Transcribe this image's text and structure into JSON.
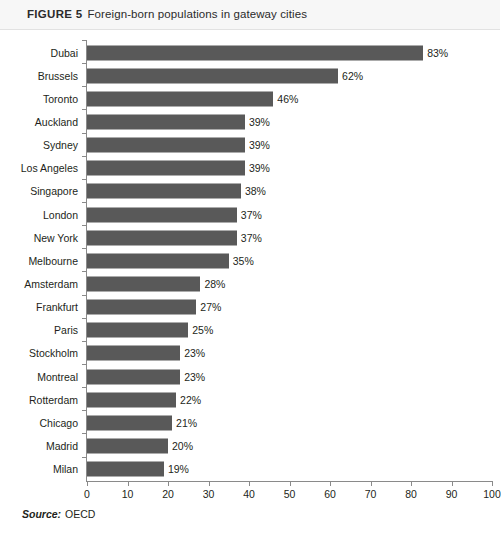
{
  "figure": {
    "number_label": "FIGURE 5",
    "caption": "Foreign-born populations in gateway cities",
    "source_label": "Source:",
    "source_value": "OECD"
  },
  "colors": {
    "bar": "#595959",
    "axis": "#8a8a8a",
    "header_background": "#f7f7f7",
    "text": "#231f20"
  },
  "chart_data": {
    "type": "bar",
    "orientation": "horizontal",
    "title": "Foreign-born populations in gateway cities",
    "xlabel": "",
    "ylabel": "",
    "xlim": [
      0,
      100
    ],
    "xticks": [
      0,
      10,
      20,
      30,
      40,
      50,
      60,
      70,
      80,
      90,
      100
    ],
    "xtick_labels": [
      "0",
      "10",
      "20",
      "30",
      "40",
      "50",
      "60",
      "70",
      "80",
      "90",
      "100"
    ],
    "grid": false,
    "legend": false,
    "value_suffix": "%",
    "categories": [
      "Dubai",
      "Brussels",
      "Toronto",
      "Auckland",
      "Sydney",
      "Los Angeles",
      "Singapore",
      "London",
      "New York",
      "Melbourne",
      "Amsterdam",
      "Frankfurt",
      "Paris",
      "Stockholm",
      "Montreal",
      "Rotterdam",
      "Chicago",
      "Madrid",
      "Milan"
    ],
    "values": [
      83,
      62,
      46,
      39,
      39,
      39,
      38,
      37,
      37,
      35,
      28,
      27,
      25,
      23,
      23,
      22,
      21,
      20,
      19
    ],
    "data_labels": [
      "83%",
      "62%",
      "46%",
      "39%",
      "39%",
      "39%",
      "38%",
      "37%",
      "37%",
      "35%",
      "28%",
      "27%",
      "25%",
      "23%",
      "23%",
      "22%",
      "21%",
      "20%",
      "19%"
    ]
  }
}
